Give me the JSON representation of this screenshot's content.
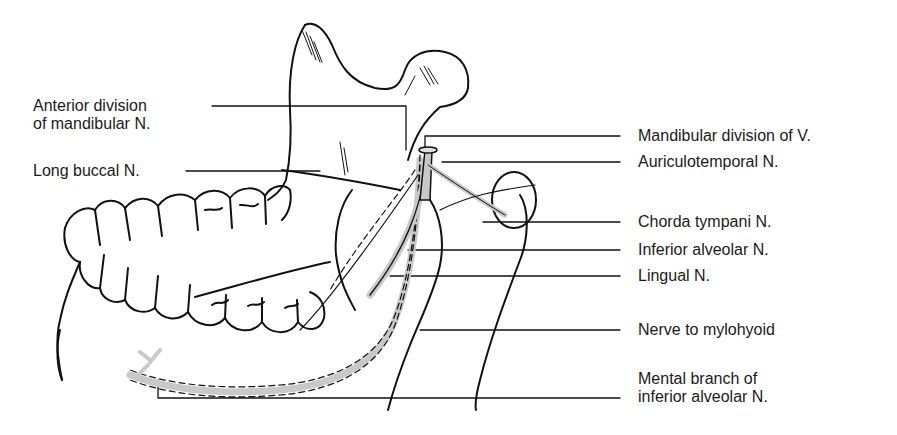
{
  "diagram": {
    "nerve_fill_color": "#c8c8c8",
    "line_color": "#111111"
  },
  "labels_left": [
    {
      "id": "anterior-division",
      "lines": [
        "Anterior division",
        "of mandibular N."
      ]
    },
    {
      "id": "long-buccal",
      "lines": [
        "Long buccal N."
      ]
    }
  ],
  "labels_right": [
    {
      "id": "mandibular-division",
      "lines": [
        "Mandibular division of V."
      ]
    },
    {
      "id": "auriculotemporal",
      "lines": [
        "Auriculotemporal N."
      ]
    },
    {
      "id": "chorda-tympani",
      "lines": [
        "Chorda tympani N."
      ]
    },
    {
      "id": "inferior-alveolar",
      "lines": [
        "Inferior alveolar N."
      ]
    },
    {
      "id": "lingual",
      "lines": [
        "Lingual N."
      ]
    },
    {
      "id": "nerve-to-mylohyoid",
      "lines": [
        "Nerve to mylohyoid"
      ]
    },
    {
      "id": "mental-branch",
      "lines": [
        "Mental branch of",
        "inferior alveolar N."
      ]
    }
  ]
}
